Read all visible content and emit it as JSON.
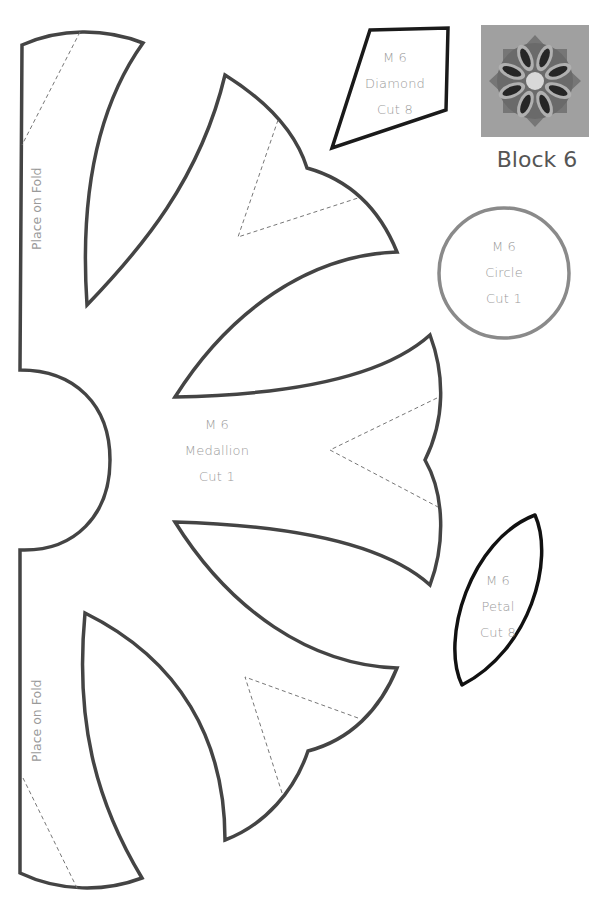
{
  "page": {
    "type": "quilt applique template sheet"
  },
  "block_preview": {
    "title": "Block 6",
    "image_description": "quilt block photo: rosette medallion with 8 petals and center circle",
    "colors": {
      "background": "#9c9c9c",
      "medallion": "#6e6e6e",
      "petal_outline": "#b5b5b5",
      "petal_fill": "#2a2a2a",
      "center": "#d8d8d8"
    }
  },
  "pieces": {
    "diamond": {
      "code": "M 6",
      "name": "Diamond",
      "cut": "Cut 8",
      "stroke": "#1a1a1a"
    },
    "circle": {
      "code": "M 6",
      "name": "Circle",
      "cut": "Cut 1",
      "stroke": "#8a8a8a"
    },
    "medallion": {
      "code": "M 6",
      "name": "Medallion",
      "cut": "Cut 1",
      "stroke": "#444444"
    },
    "petal": {
      "code": "M 6",
      "name": "Petal",
      "cut": "Cut 8",
      "stroke": "#111111"
    }
  },
  "fold_labels": {
    "top": "Place on Fold",
    "bottom": "Place on Fold"
  }
}
